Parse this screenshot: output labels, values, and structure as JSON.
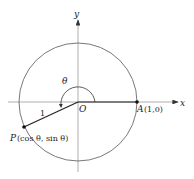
{
  "diagram": {
    "axes": {
      "x_label": "x",
      "y_label": "y"
    },
    "origin_label": "O",
    "angle_label": "θ",
    "radius_label": "1",
    "point_a": {
      "name": "A",
      "coords": "(1,0)"
    },
    "point_p": {
      "name": "P",
      "coords": "(cos θ, sin θ)"
    },
    "colors": {
      "stroke": "#333333",
      "axis": "#888888"
    }
  }
}
